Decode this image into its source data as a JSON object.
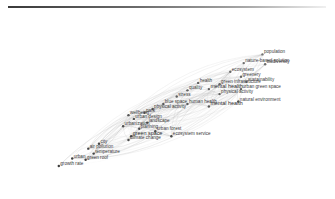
{
  "legend": {
    "gradient": [
      "#3a3a3a",
      "#f0f0f0"
    ],
    "label": ""
  },
  "network": {
    "nodes": [
      {
        "label": "population",
        "x": 0.86,
        "y": 0.1
      },
      {
        "label": "nature-based solution",
        "x": 0.79,
        "y": 0.17
      },
      {
        "label": "biodiversity",
        "x": 0.87,
        "y": 0.18
      },
      {
        "label": "ecosystem",
        "x": 0.74,
        "y": 0.24
      },
      {
        "label": "greenery",
        "x": 0.78,
        "y": 0.28
      },
      {
        "label": "sustainability",
        "x": 0.8,
        "y": 0.32
      },
      {
        "label": "health",
        "x": 0.62,
        "y": 0.33
      },
      {
        "label": "green infrastructure",
        "x": 0.7,
        "y": 0.34
      },
      {
        "label": "urban green space",
        "x": 0.78,
        "y": 0.38
      },
      {
        "label": "quality",
        "x": 0.58,
        "y": 0.39
      },
      {
        "label": "mental health",
        "x": 0.66,
        "y": 0.38
      },
      {
        "label": "physical activity",
        "x": 0.7,
        "y": 0.42
      },
      {
        "label": "stress",
        "x": 0.54,
        "y": 0.44
      },
      {
        "label": "natural environment",
        "x": 0.77,
        "y": 0.48
      },
      {
        "label": "blue space",
        "x": 0.49,
        "y": 0.5
      },
      {
        "label": "human health",
        "x": 0.58,
        "y": 0.5
      },
      {
        "label": "mental health",
        "x": 0.66,
        "y": 0.52
      },
      {
        "label": "physical activity",
        "x": 0.45,
        "y": 0.54
      },
      {
        "label": "park",
        "x": 0.42,
        "y": 0.57
      },
      {
        "label": "wellbeing",
        "x": 0.36,
        "y": 0.59
      },
      {
        "label": "urban design",
        "x": 0.38,
        "y": 0.62
      },
      {
        "label": "landscape",
        "x": 0.43,
        "y": 0.65
      },
      {
        "label": "urbanization",
        "x": 0.34,
        "y": 0.68
      },
      {
        "label": "planning",
        "x": 0.4,
        "y": 0.7
      },
      {
        "label": "urban forest",
        "x": 0.46,
        "y": 0.72
      },
      {
        "label": "green space",
        "x": 0.37,
        "y": 0.76
      },
      {
        "label": "ecosystem service",
        "x": 0.52,
        "y": 0.76
      },
      {
        "label": "climate change",
        "x": 0.36,
        "y": 0.79
      },
      {
        "label": "city",
        "x": 0.25,
        "y": 0.82
      },
      {
        "label": "air pollution",
        "x": 0.21,
        "y": 0.86
      },
      {
        "label": "temperature",
        "x": 0.23,
        "y": 0.9
      },
      {
        "label": "urban",
        "x": 0.15,
        "y": 0.94
      },
      {
        "label": "green roof",
        "x": 0.2,
        "y": 0.95
      },
      {
        "label": "growth rate",
        "x": 0.1,
        "y": 1.0
      }
    ]
  }
}
